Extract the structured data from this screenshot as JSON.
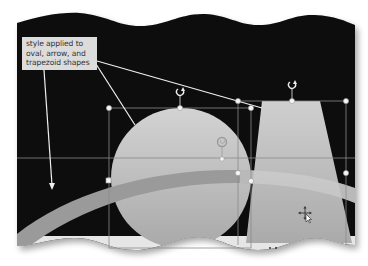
{
  "callout": {
    "lines": [
      "style applied to",
      "oval, arrow, and",
      "trapezoid shapes"
    ]
  },
  "slide": {
    "background_color": "#0b0b0b",
    "shape_fill_color": "#c2c2c2",
    "arrow_fill_color": "#9a9a9a",
    "callout_fill_color": "#dcdcdc",
    "selection_handle_color": "#f2f2f2"
  },
  "shapes": [
    {
      "name": "oval",
      "selected": true
    },
    {
      "name": "arrow",
      "selected": true
    },
    {
      "name": "trapezoid",
      "selected": true
    }
  ],
  "cursor": {
    "type": "move-cursor"
  }
}
